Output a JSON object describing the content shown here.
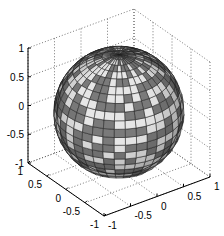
{
  "chart_data": {
    "type": "surface",
    "title": "",
    "surface": {
      "shape": "sphere",
      "center": [
        0,
        0,
        0
      ],
      "radius": 1,
      "lat_divisions": 24,
      "lon_divisions": 36,
      "colors": {
        "light": "#e6e6e6",
        "dark": "#7a7a7a",
        "edge": "#222222"
      },
      "pattern_seed": 7
    },
    "axes": {
      "x": {
        "ticks": [
          -1,
          -0.5,
          0,
          0.5,
          1
        ],
        "tick_labels": [
          "-1",
          "-0.5",
          "0",
          "0.5",
          "1"
        ],
        "lim": [
          -1,
          1
        ]
      },
      "y": {
        "ticks": [
          1,
          0.5,
          0,
          -0.5,
          -1
        ],
        "tick_labels": [
          "1",
          "0.5",
          "0",
          "-0.5",
          "-1"
        ],
        "lim": [
          -1,
          1
        ]
      },
      "z": {
        "ticks": [
          1,
          0.5,
          0,
          -0.5,
          -1
        ],
        "tick_labels": [
          "1",
          "0.5",
          "0",
          "-0.5",
          "-1"
        ],
        "lim": [
          -1,
          1
        ]
      },
      "grid": true,
      "box": true
    },
    "xlabel": "",
    "ylabel": "",
    "zlabel": ""
  }
}
